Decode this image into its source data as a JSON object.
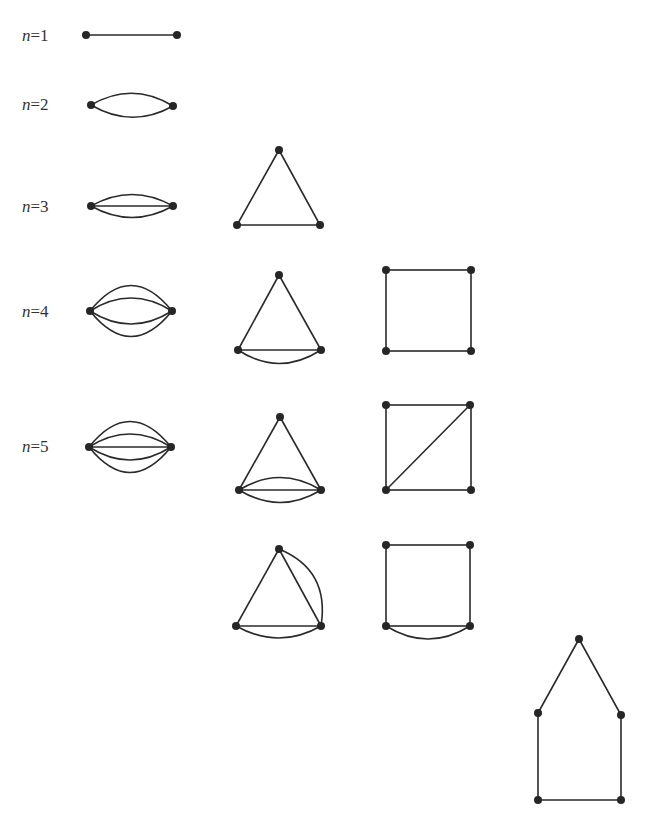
{
  "figure": {
    "rows": [
      {
        "label_var": "n",
        "label_eq": "=",
        "label_num": "1"
      },
      {
        "label_var": "n",
        "label_eq": "=",
        "label_num": "2"
      },
      {
        "label_var": "n",
        "label_eq": "=",
        "label_num": "3"
      },
      {
        "label_var": "n",
        "label_eq": "=",
        "label_num": "4"
      },
      {
        "label_var": "n",
        "label_eq": "=",
        "label_num": "5"
      }
    ],
    "colors": {
      "edge": "#2a2a2a",
      "vertex": "#262626",
      "background": "#ffffff"
    }
  }
}
